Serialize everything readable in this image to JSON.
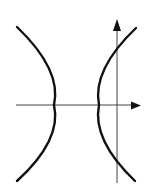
{
  "figure": {
    "type": "hyperbola-with-axes",
    "colors": {
      "curve": "#111111",
      "axis": "#444444",
      "background": "#ffffff"
    },
    "x_axis": {
      "from": [
        16,
        105
      ],
      "to": [
        140,
        105
      ],
      "arrow": "right"
    },
    "y_axis": {
      "from": [
        117,
        183
      ],
      "to": [
        117,
        20
      ],
      "arrow": "up"
    },
    "branches": [
      {
        "name": "left-branch",
        "top": [
          17,
          27
        ],
        "vertex": [
          54,
          105
        ],
        "bottom": [
          17,
          181
        ]
      },
      {
        "name": "right-branch",
        "top": [
          136,
          28
        ],
        "vertex": [
          99,
          105
        ],
        "bottom": [
          135,
          181
        ]
      }
    ]
  }
}
